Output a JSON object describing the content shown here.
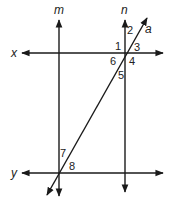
{
  "diagram": {
    "type": "parallel-lines-transversal",
    "line_color": "#1a1a1a",
    "lines": {
      "m": {
        "label": "m",
        "orientation": "vertical"
      },
      "n": {
        "label": "n",
        "orientation": "vertical"
      },
      "x": {
        "label": "x",
        "orientation": "horizontal"
      },
      "y": {
        "label": "y",
        "orientation": "horizontal"
      },
      "a": {
        "label": "a",
        "orientation": "transversal"
      }
    },
    "angles": [
      "1",
      "2",
      "3",
      "4",
      "5",
      "6",
      "7",
      "8"
    ]
  }
}
